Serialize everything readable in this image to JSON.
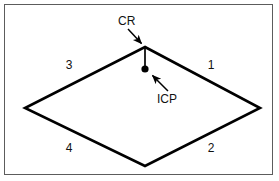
{
  "figure": {
    "background_color": "#ffffff",
    "frame_color": "#5c5c5c",
    "stroke_color": "#000000",
    "title": "",
    "shape": "diamond"
  },
  "diagram": {
    "type": "line-diagram",
    "shape_name": "diamond",
    "vertices": {
      "top": {
        "x": 145,
        "y": 47
      },
      "right": {
        "x": 260,
        "y": 108
      },
      "bottom": {
        "x": 145,
        "y": 166
      },
      "left": {
        "x": 25,
        "y": 108
      }
    },
    "quadrant_labels": [
      {
        "text": "1",
        "x": 211,
        "y": 69
      },
      {
        "text": "2",
        "x": 211,
        "y": 152
      },
      {
        "text": "3",
        "x": 69,
        "y": 69
      },
      {
        "text": "4",
        "x": 69,
        "y": 152
      }
    ],
    "callouts": [
      {
        "id": "cr",
        "text": "CR",
        "text_x": 118,
        "text_y": 25,
        "arrow_from": {
          "x": 128,
          "y": 29
        },
        "arrow_to": {
          "x": 143,
          "y": 45
        },
        "points_to": "top-vertex"
      },
      {
        "id": "icp",
        "text": "ICP",
        "text_x": 157,
        "text_y": 103,
        "arrow_from": {
          "x": 168,
          "y": 91
        },
        "arrow_to": {
          "x": 151,
          "y": 74
        },
        "points_to": "interior-contact-point"
      }
    ],
    "markers": [
      {
        "id": "icp-dot",
        "shape": "filled-circle",
        "x": 145,
        "y": 69,
        "radius": 3.6,
        "color": "#000000"
      }
    ],
    "segments": [
      {
        "id": "stem",
        "from": {
          "x": 145,
          "y": 47
        },
        "to": {
          "x": 145,
          "y": 69
        },
        "width": 1.6
      }
    ]
  }
}
